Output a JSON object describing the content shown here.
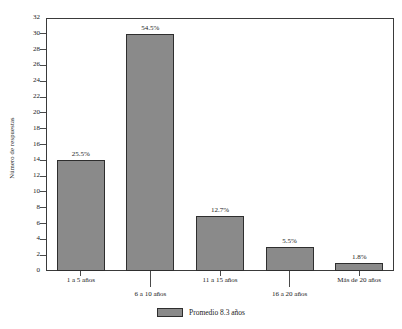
{
  "chart_data": {
    "type": "bar",
    "title": "",
    "xlabel": "",
    "ylabel": "Número de respuestas",
    "categories": [
      "1 a 5 años",
      "6 a 10 años",
      "11 a 15 años",
      "16 a 20 años",
      "Más de 20  años"
    ],
    "values": [
      14,
      30,
      7,
      3,
      1
    ],
    "data_labels": [
      "25.5%",
      "54.5%",
      "12.7%",
      "5.5%",
      "1.8%"
    ],
    "ylim": [
      0,
      32
    ],
    "ytick_step": 2,
    "yticks": [
      "0",
      "2",
      "4",
      "6",
      "8",
      "10",
      "12",
      "14",
      "16",
      "18",
      "20",
      "22",
      "24",
      "26",
      "28",
      "30",
      "32"
    ],
    "grid": false,
    "legend": {
      "position": "bottom-center",
      "entries": [
        {
          "label": "Promedio 8.3 años",
          "color": "#8a8a8a"
        }
      ]
    },
    "series": [
      {
        "name": "Promedio 8.3 años",
        "values": [
          14,
          30,
          7,
          3,
          1
        ],
        "color": "#8a8a8a"
      }
    ],
    "colors": {
      "bar_fill": "#8a8a8a",
      "bar_border": "#2e2e2e",
      "axis": "#3a3a3a",
      "text": "#1a1a1a",
      "background": "#ffffff"
    }
  },
  "axis": {
    "y_title": "Número de respuestas"
  },
  "legend": {
    "label": "Promedio 8.3 años"
  },
  "header": {
    "title_fragment": ""
  }
}
